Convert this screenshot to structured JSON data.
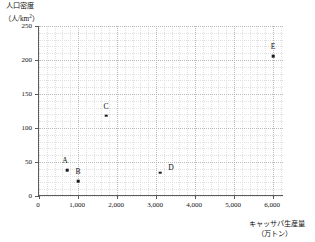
{
  "chart_data": {
    "type": "scatter",
    "title": "",
    "xlabel": "キャッサバ生産量（万トン）",
    "ylabel": "人口密度（人/km²）",
    "xlabel_lines": [
      "キャッサバ生産量",
      "（万トン）"
    ],
    "ylabel_lines": [
      "人口密度",
      "（人/km"
    ],
    "ylabel_superscript": "2",
    "ylabel_suffix": "）",
    "xlim": [
      0,
      6280
    ],
    "ylim": [
      0,
      250
    ],
    "grid": true,
    "grid_style": "dotted",
    "legend": "none",
    "xticks": [
      0,
      1000,
      2000,
      3000,
      4000,
      5000,
      6000
    ],
    "xticklabels": [
      "0",
      "1,000",
      "2,000",
      "3,000",
      "4,000",
      "5,000",
      "6,000"
    ],
    "yticks": [
      0,
      50,
      100,
      150,
      200,
      250
    ],
    "yticklabels": [
      "0",
      "50",
      "100",
      "150",
      "200",
      "250"
    ],
    "x_minor_interval": 200,
    "y_minor_interval": 10,
    "marker": "square",
    "marker_color": "#1a1a1a",
    "points": [
      {
        "label": "A",
        "x": 720,
        "y": 38,
        "label_dx": -2,
        "label_dy": -5
      },
      {
        "label": "B",
        "x": 1000,
        "y": 22,
        "label_dx": 0,
        "label_dy": -5
      },
      {
        "label": "C",
        "x": 1720,
        "y": 118,
        "label_dx": 0,
        "label_dy": -5
      },
      {
        "label": "D",
        "x": 3100,
        "y": 34,
        "label_dx": 11,
        "label_dy": -1
      },
      {
        "label": "E",
        "x": 6000,
        "y": 206,
        "label_dx": 0,
        "label_dy": -5
      }
    ]
  },
  "colors": {
    "axis": "#5a5a5a",
    "grid_major": "#b9b9b9",
    "grid_minor": "#e0e0e0",
    "text": "#111111",
    "marker": "#1a1a1a",
    "background": "#ffffff"
  }
}
